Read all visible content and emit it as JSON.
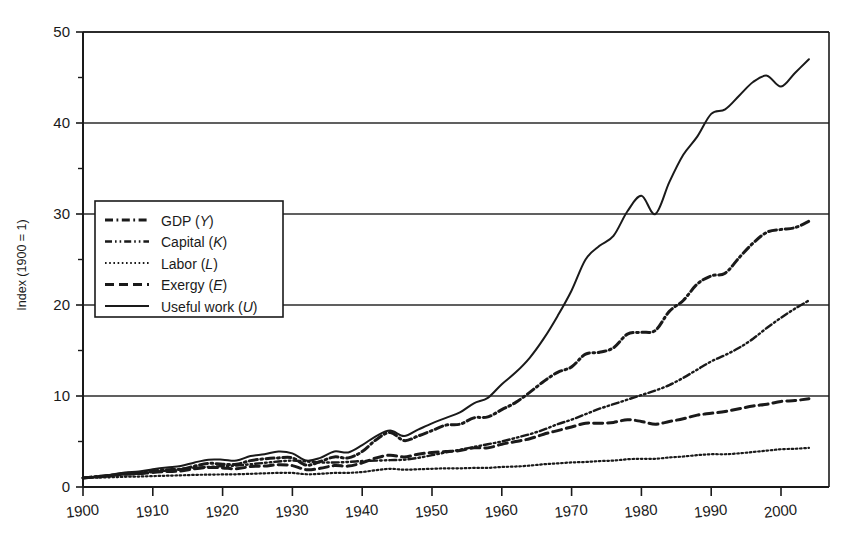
{
  "chart_data": {
    "type": "line",
    "title": "",
    "xlabel": "",
    "ylabel": "Index (1900 = 1)",
    "xlim": [
      1900,
      2004
    ],
    "ylim": [
      0,
      50
    ],
    "grid": "horizontal-major",
    "legend_position": "upper-left-inside",
    "x_ticks": [
      1900,
      1910,
      1920,
      1930,
      1940,
      1950,
      1960,
      1970,
      1980,
      1990,
      2000
    ],
    "x_tick_labels": [
      "1900",
      "1910",
      "1920",
      "1930",
      "1940",
      "1950",
      "1960",
      "1970",
      "1980",
      "1990",
      "2000"
    ],
    "y_ticks": [
      0,
      10,
      20,
      30,
      40,
      50
    ],
    "y_tick_labels": [
      "0",
      "10",
      "20",
      "30",
      "40",
      "50"
    ],
    "y_minor_ticks": [
      5,
      15,
      25,
      35,
      45
    ],
    "x": [
      1900,
      1902,
      1904,
      1906,
      1908,
      1910,
      1912,
      1914,
      1916,
      1918,
      1920,
      1922,
      1924,
      1926,
      1928,
      1930,
      1932,
      1934,
      1936,
      1938,
      1940,
      1942,
      1944,
      1946,
      1948,
      1950,
      1952,
      1954,
      1956,
      1958,
      1960,
      1962,
      1964,
      1966,
      1968,
      1970,
      1972,
      1974,
      1976,
      1978,
      1980,
      1982,
      1984,
      1986,
      1988,
      1990,
      1992,
      1994,
      1996,
      1998,
      2000,
      2002,
      2004
    ],
    "series": [
      {
        "name": "GDP (Y)",
        "symbol": "Y",
        "label_base": "GDP",
        "line_style": "dash-dot",
        "color": "#1a1a1a",
        "values": [
          1.0,
          1.15,
          1.3,
          1.5,
          1.5,
          1.75,
          1.9,
          1.95,
          2.3,
          2.6,
          2.5,
          2.5,
          2.9,
          3.1,
          3.2,
          3.2,
          2.4,
          2.8,
          3.3,
          3.2,
          3.9,
          5.2,
          6.0,
          5.1,
          5.6,
          6.2,
          6.8,
          6.9,
          7.6,
          7.7,
          8.5,
          9.3,
          10.4,
          11.6,
          12.6,
          13.2,
          14.6,
          14.8,
          15.3,
          16.8,
          17.0,
          17.2,
          19.3,
          20.5,
          22.3,
          23.2,
          23.5,
          25.2,
          26.8,
          28.0,
          28.3,
          28.5,
          29.2
        ]
      },
      {
        "name": "Capital (K)",
        "symbol": "K",
        "label_base": "Capital",
        "line_style": "dash-dot-dot",
        "color": "#3a3a3a",
        "values": [
          1.0,
          1.1,
          1.25,
          1.4,
          1.5,
          1.65,
          1.8,
          1.95,
          2.1,
          2.2,
          2.3,
          2.35,
          2.5,
          2.65,
          2.8,
          2.9,
          2.8,
          2.7,
          2.7,
          2.75,
          2.85,
          2.9,
          2.95,
          3.0,
          3.2,
          3.5,
          3.8,
          4.1,
          4.4,
          4.7,
          5.0,
          5.4,
          5.8,
          6.3,
          6.9,
          7.4,
          8.0,
          8.6,
          9.1,
          9.6,
          10.1,
          10.6,
          11.2,
          12.0,
          12.9,
          13.8,
          14.5,
          15.3,
          16.3,
          17.5,
          18.6,
          19.6,
          20.5
        ]
      },
      {
        "name": "Labor (L)",
        "symbol": "L",
        "label_base": "Labor",
        "line_style": "dotted",
        "color": "#2a2a2a",
        "values": [
          1.0,
          1.03,
          1.07,
          1.12,
          1.15,
          1.2,
          1.24,
          1.28,
          1.33,
          1.36,
          1.38,
          1.4,
          1.45,
          1.5,
          1.55,
          1.55,
          1.4,
          1.45,
          1.55,
          1.55,
          1.65,
          1.85,
          2.0,
          1.9,
          1.95,
          2.0,
          2.05,
          2.05,
          2.1,
          2.1,
          2.2,
          2.25,
          2.35,
          2.5,
          2.6,
          2.7,
          2.75,
          2.85,
          2.9,
          3.05,
          3.1,
          3.1,
          3.25,
          3.35,
          3.5,
          3.6,
          3.6,
          3.7,
          3.85,
          4.0,
          4.15,
          4.2,
          4.3
        ]
      },
      {
        "name": "Exergy (E)",
        "symbol": "E",
        "label_base": "Exergy",
        "line_style": "dashed",
        "color": "#3a3a3a",
        "values": [
          1.0,
          1.1,
          1.25,
          1.4,
          1.45,
          1.6,
          1.7,
          1.75,
          2.0,
          2.15,
          2.1,
          2.0,
          2.25,
          2.3,
          2.45,
          2.35,
          1.9,
          2.05,
          2.35,
          2.3,
          2.65,
          3.2,
          3.5,
          3.3,
          3.6,
          3.8,
          3.9,
          4.0,
          4.3,
          4.3,
          4.7,
          5.0,
          5.3,
          5.8,
          6.2,
          6.6,
          7.0,
          7.0,
          7.1,
          7.4,
          7.2,
          6.9,
          7.2,
          7.5,
          7.9,
          8.1,
          8.3,
          8.6,
          8.9,
          9.1,
          9.4,
          9.5,
          9.7
        ]
      },
      {
        "name": "Useful work (U)",
        "symbol": "U",
        "label_base": "Useful work",
        "line_style": "solid",
        "color": "#1a1a1a",
        "values": [
          1.0,
          1.15,
          1.35,
          1.6,
          1.7,
          1.95,
          2.15,
          2.3,
          2.7,
          3.0,
          3.0,
          2.9,
          3.4,
          3.6,
          3.9,
          3.7,
          2.9,
          3.2,
          3.9,
          3.8,
          4.6,
          5.6,
          6.2,
          5.6,
          6.3,
          7.0,
          7.6,
          8.2,
          9.2,
          9.8,
          11.3,
          12.6,
          14.2,
          16.3,
          18.8,
          21.6,
          25.0,
          26.5,
          27.6,
          30.3,
          32.0,
          30.0,
          33.5,
          36.5,
          38.5,
          41.0,
          41.5,
          43.0,
          44.5,
          45.2,
          44.0,
          45.5,
          47.0
        ]
      }
    ]
  },
  "legend": {
    "entries": [
      {
        "label": "GDP",
        "symbol": "Y",
        "full": "GDP (Y)"
      },
      {
        "label": "Capital",
        "symbol": "K",
        "full": "Capital (K)"
      },
      {
        "label": "Labor",
        "symbol": "L",
        "full": "Labor (L)"
      },
      {
        "label": "Exergy",
        "symbol": "E",
        "full": "Exergy (E)"
      },
      {
        "label": "Useful work",
        "symbol": "U",
        "full": "Useful work (U)"
      }
    ]
  },
  "colors": {
    "ink": "#1a1a1a",
    "grid": "#2b2b2b",
    "background": "#ffffff"
  }
}
